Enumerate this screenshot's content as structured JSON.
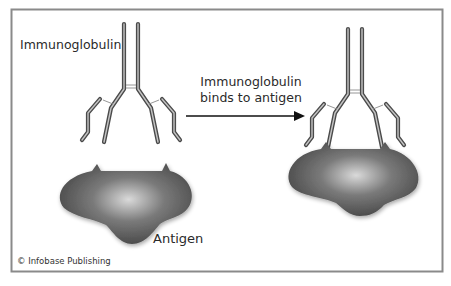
{
  "figure": {
    "labels": {
      "immunoglobulin": "Immunoglobulin",
      "process_line1": "Immunoglobulin",
      "process_line2": "binds to antigen",
      "antigen": "Antigen",
      "copyright": "© Infobase Publishing"
    },
    "colors": {
      "frame": "#8a8a8a",
      "antibody_stroke": "#4a4a4a",
      "antibody_fill": "#b8b8b8",
      "antigen_dark": "#4f4f4f",
      "antigen_light": "#d8d8d8",
      "arrow": "#111111"
    },
    "panels": [
      {
        "name": "before",
        "description": "Free immunoglobulin above separate antigen"
      },
      {
        "name": "after",
        "description": "Immunoglobulin bound to antigen"
      }
    ]
  }
}
